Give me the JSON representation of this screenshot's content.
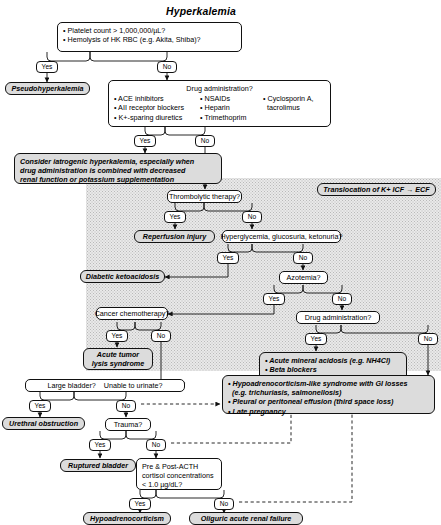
{
  "title": "Hyperkalemia",
  "labels": {
    "yes": "Yes",
    "no": "No"
  },
  "nodes": {
    "initial_screen": {
      "line1": "• Platelet count > 1,000,000/µL?",
      "line2": "• Hemolysis of HK RBC (e.g. Akita, Shiba)?"
    },
    "pseudohyperkalemia": "Pseudohyperkalemia",
    "drug_admin_top": {
      "header": "Drug administration?",
      "col1": [
        "• ACE inhibitors",
        "• AII receptor blockers",
        "• K+-sparing diuretics"
      ],
      "col2": [
        "• NSAIDs",
        "• Heparin",
        "• Trimethoprim"
      ],
      "col3": [
        "• Cyclosporin A,",
        "tacrolimus"
      ]
    },
    "iatrogenic": {
      "line1": "Consider iatrogenic hyperkalemia, especially when",
      "line2": "drug administration is combined with decreased",
      "line3": "renal function or potassium supplementation"
    },
    "translocation_header": "Translocation of K+ ICF → ECF",
    "thrombolytic": "Thrombolytic therapy?",
    "reperfusion": "Reperfusion injury",
    "hyperglycemia": "Hyperglycemia, glucosuria, ketonuria?",
    "dka": "Diabetic ketoacidosis",
    "azotemia": "Azotemia?",
    "cancer_chemo": "Cancer chemotherapy?",
    "drug_admin_2": "Drug administration?",
    "tumor_lysis": {
      "line1": "Acute tumor",
      "line2": "lysis syndrome"
    },
    "drug_list_2": [
      "• Acute mineral acidosis (e.g. NH4Cl)",
      "• Beta blockers",
      "• Cardiac glycosides",
      "• Lysine or arginine infusion"
    ],
    "hypoadreno_like": [
      "• Hypoadrenocorticism-like syndrome with GI losses",
      "(e.g. trichuriasis, salmonellosis)",
      "• Pleural or peritoneal effusion (third space loss)",
      "• Late pregnancy"
    ],
    "bladder": {
      "part1": "Large bladder?",
      "part2": "Unable to urinate?"
    },
    "urethral_obstruction": "Urethral obstruction",
    "trauma": "Trauma?",
    "ruptured_bladder": "Ruptured bladder",
    "acth": {
      "line1": "Pre & Post-ACTH",
      "line2": "cortisol concentrations",
      "line3": "< 1.0 µg/dL?"
    },
    "hypoadrenocorticism": "Hypoadrenocorticism",
    "oliguric": "Oliguric acute renal failure"
  },
  "colors": {
    "terminal_fill": "#dcdcdc",
    "shade_fill": "#e9e9e9",
    "stroke": "#111111"
  }
}
